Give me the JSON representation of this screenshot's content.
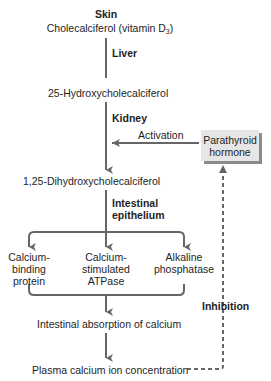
{
  "colors": {
    "arrow": "#666666",
    "text": "#1e1e1e",
    "pth_box_fill": "#e6e6e6",
    "pth_box_shadow": "#8a8a8a"
  },
  "nodes": {
    "skin_label": "Skin",
    "cholecalciferol": "Cholecalciferol (vitamin D",
    "cholecalciferol_sub": "3",
    "cholecalciferol_close": ")",
    "liver_label": "Liver",
    "hydroxy25": "25-Hydroxycholecalciferol",
    "kidney_label": "Kidney",
    "activation_label": "Activation",
    "pth_line1": "Parathyroid",
    "pth_line2": "hormone",
    "dihydroxy": "1,25-Dihydroxycholecalciferol",
    "intestinal_label_1": "Intestinal",
    "intestinal_label_2": "epithelium",
    "branch_1": [
      "Calcium-",
      "binding",
      "protein"
    ],
    "branch_2": [
      "Calcium-",
      "stimulated",
      "ATPase"
    ],
    "branch_3": [
      "Alkaline",
      "phosphatase"
    ],
    "absorption": "Intestinal absorption of calcium",
    "plasma": "Plasma calcium ion concentration",
    "inhibition_label": "Inhibition"
  }
}
